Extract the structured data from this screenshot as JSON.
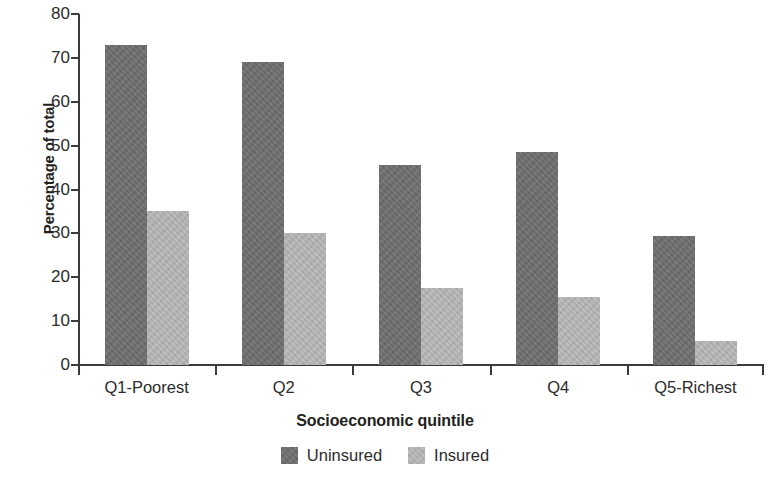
{
  "chart_data": {
    "type": "bar",
    "title": "",
    "xlabel": "Socioeconomic quintile",
    "ylabel": "Percentage of total",
    "categories": [
      "Q1-Poorest",
      "Q2",
      "Q3",
      "Q4",
      "Q5-Richest"
    ],
    "series": [
      {
        "name": "Uninsured",
        "color": "#6f6f6f",
        "values": [
          73,
          69,
          45.5,
          48.5,
          29.5
        ]
      },
      {
        "name": "Insured",
        "color": "#b5b5b5",
        "values": [
          35,
          30,
          17.5,
          15.5,
          5.5
        ]
      }
    ],
    "ylim": [
      0,
      80
    ],
    "ytick_values": [
      0,
      10,
      20,
      30,
      40,
      50,
      60,
      70,
      80
    ],
    "ytick_labels": [
      "0",
      "10",
      "20",
      "30",
      "40",
      "50",
      "60",
      "70",
      "80"
    ],
    "grid": false,
    "legend_position": "bottom-center"
  },
  "legend": {
    "items": [
      {
        "label": "Uninsured",
        "color": "#6f6f6f"
      },
      {
        "label": "Insured",
        "color": "#b5b5b5"
      }
    ]
  }
}
